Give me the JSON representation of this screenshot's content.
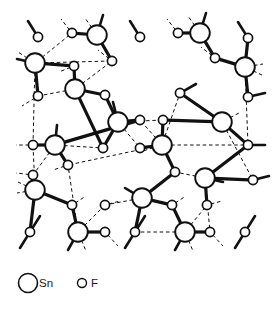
{
  "figure": {
    "name": "sn-f-crystal-structure",
    "background_color": "#ffffff",
    "stroke_color": "#111111",
    "atom_fill": "#ffffff"
  },
  "legend": {
    "items": [
      {
        "symbol": "Sn",
        "label": "Sn",
        "marker": "large-open-circle",
        "radius": 9.5
      },
      {
        "symbol": "F",
        "label": "F",
        "marker": "small-open-circle",
        "radius": 4.5
      }
    ],
    "sn_label": "Sn",
    "f_label": "F",
    "sn_marker_cx": 28,
    "sn_marker_cy": 283,
    "sn_text_x": 39,
    "sn_text_y": 287,
    "f_marker_cx": 82,
    "f_marker_cy": 283,
    "f_text_x": 91,
    "f_text_y": 287
  },
  "structure": {
    "sn_radius": 9.8,
    "f_radius": 4.6,
    "bond_width": 3.2,
    "dash_width": 1.0,
    "dash_pattern": "3.5,2.8",
    "stub_width": 2.6,
    "sn_atoms": [
      {
        "id": "sn1",
        "x": 35,
        "y": 63
      },
      {
        "id": "sn2",
        "x": 97,
        "y": 35
      },
      {
        "id": "sn3",
        "x": 75,
        "y": 89
      },
      {
        "id": "sn4",
        "x": 118,
        "y": 122
      },
      {
        "id": "sn5",
        "x": 162,
        "y": 145
      },
      {
        "id": "sn6",
        "x": 200,
        "y": 33
      },
      {
        "id": "sn7",
        "x": 245,
        "y": 67
      },
      {
        "id": "sn8",
        "x": 222,
        "y": 122
      },
      {
        "id": "sn9",
        "x": 55,
        "y": 145
      },
      {
        "id": "sn10",
        "x": 35,
        "y": 190
      },
      {
        "id": "sn11",
        "x": 78,
        "y": 232
      },
      {
        "id": "sn12",
        "x": 142,
        "y": 198
      },
      {
        "id": "sn13",
        "x": 185,
        "y": 232
      },
      {
        "id": "sn14",
        "x": 205,
        "y": 178
      }
    ],
    "f_atoms": [
      {
        "id": "f1",
        "x": 38,
        "y": 37
      },
      {
        "id": "f2",
        "x": 72,
        "y": 33
      },
      {
        "id": "f3",
        "x": 140,
        "y": 37
      },
      {
        "id": "f4",
        "x": 178,
        "y": 33
      },
      {
        "id": "f5",
        "x": 248,
        "y": 38
      },
      {
        "id": "f6",
        "x": 74,
        "y": 66
      },
      {
        "id": "f7",
        "x": 112,
        "y": 61
      },
      {
        "id": "f8",
        "x": 215,
        "y": 58
      },
      {
        "id": "f9",
        "x": 38,
        "y": 96
      },
      {
        "id": "f10",
        "x": 105,
        "y": 95
      },
      {
        "id": "f11",
        "x": 180,
        "y": 93
      },
      {
        "id": "f12",
        "x": 248,
        "y": 97
      },
      {
        "id": "f13",
        "x": 140,
        "y": 120
      },
      {
        "id": "f14",
        "x": 163,
        "y": 120
      },
      {
        "id": "f15",
        "x": 33,
        "y": 145
      },
      {
        "id": "f16",
        "x": 103,
        "y": 148
      },
      {
        "id": "f17",
        "x": 140,
        "y": 148
      },
      {
        "id": "f18",
        "x": 248,
        "y": 145
      },
      {
        "id": "f19",
        "x": 33,
        "y": 175
      },
      {
        "id": "f20",
        "x": 68,
        "y": 165
      },
      {
        "id": "f21",
        "x": 175,
        "y": 172
      },
      {
        "id": "f22",
        "x": 253,
        "y": 180
      },
      {
        "id": "f23",
        "x": 72,
        "y": 205
      },
      {
        "id": "f24",
        "x": 105,
        "y": 205
      },
      {
        "id": "f25",
        "x": 172,
        "y": 205
      },
      {
        "id": "f26",
        "x": 207,
        "y": 205
      },
      {
        "id": "f27",
        "x": 30,
        "y": 232
      },
      {
        "id": "f28",
        "x": 105,
        "y": 232
      },
      {
        "id": "f29",
        "x": 135,
        "y": 232
      },
      {
        "id": "f30",
        "x": 210,
        "y": 232
      },
      {
        "id": "f31",
        "x": 245,
        "y": 232
      }
    ],
    "bonds": [
      {
        "from": "sn1",
        "to": "f6"
      },
      {
        "from": "sn1",
        "to": "f9"
      },
      {
        "from": "sn2",
        "to": "f2"
      },
      {
        "from": "sn2",
        "to": "f7"
      },
      {
        "from": "sn3",
        "to": "f6"
      },
      {
        "from": "sn3",
        "to": "f10"
      },
      {
        "from": "sn3",
        "to": "f16"
      },
      {
        "from": "sn4",
        "to": "f10"
      },
      {
        "from": "sn4",
        "to": "f13"
      },
      {
        "from": "sn4",
        "to": "f16"
      },
      {
        "from": "sn5",
        "to": "f14"
      },
      {
        "from": "sn5",
        "to": "f17"
      },
      {
        "from": "sn5",
        "to": "f21"
      },
      {
        "from": "sn6",
        "to": "f4"
      },
      {
        "from": "sn6",
        "to": "f8"
      },
      {
        "from": "sn7",
        "to": "f5"
      },
      {
        "from": "sn7",
        "to": "f8"
      },
      {
        "from": "sn7",
        "to": "f12"
      },
      {
        "from": "sn8",
        "to": "f11"
      },
      {
        "from": "sn8",
        "to": "f14"
      },
      {
        "from": "sn8",
        "to": "f18"
      },
      {
        "from": "sn9",
        "to": "f15"
      },
      {
        "from": "sn9",
        "to": "f20"
      },
      {
        "from": "sn9",
        "to": "f13"
      },
      {
        "from": "sn10",
        "to": "f19"
      },
      {
        "from": "sn10",
        "to": "f23"
      },
      {
        "from": "sn10",
        "to": "f27"
      },
      {
        "from": "sn11",
        "to": "f23"
      },
      {
        "from": "sn11",
        "to": "f28"
      },
      {
        "from": "sn12",
        "to": "f21"
      },
      {
        "from": "sn12",
        "to": "f25"
      },
      {
        "from": "sn12",
        "to": "f29"
      },
      {
        "from": "sn13",
        "to": "f25"
      },
      {
        "from": "sn13",
        "to": "f30"
      },
      {
        "from": "sn14",
        "to": "f22"
      },
      {
        "from": "sn14",
        "to": "f26"
      },
      {
        "from": "sn14",
        "to": "f18"
      }
    ],
    "contacts": [
      {
        "from": "sn1",
        "to": "f7"
      },
      {
        "from": "sn1",
        "to": "f2"
      },
      {
        "from": "sn1",
        "to": "f15"
      },
      {
        "from": "sn2",
        "to": "f7"
      },
      {
        "from": "sn3",
        "to": "f7"
      },
      {
        "from": "sn3",
        "to": "f9"
      },
      {
        "from": "sn4",
        "to": "f17"
      },
      {
        "from": "sn5",
        "to": "f13"
      },
      {
        "from": "sn5",
        "to": "f11"
      },
      {
        "from": "sn5",
        "to": "f18"
      },
      {
        "from": "sn5",
        "to": "f20"
      },
      {
        "from": "sn6",
        "to": "f8"
      },
      {
        "from": "sn7",
        "to": "f18"
      },
      {
        "from": "sn8",
        "to": "f22"
      },
      {
        "from": "sn9",
        "to": "f19"
      },
      {
        "from": "sn9",
        "to": "f16"
      },
      {
        "from": "sn10",
        "to": "f15"
      },
      {
        "from": "sn11",
        "to": "f24"
      },
      {
        "from": "sn11",
        "to": "f20"
      },
      {
        "from": "sn12",
        "to": "f24"
      },
      {
        "from": "sn13",
        "to": "f26"
      },
      {
        "from": "sn13",
        "to": "f29"
      },
      {
        "from": "sn14",
        "to": "f21"
      },
      {
        "from": "sn14",
        "to": "f30"
      },
      {
        "from": "sn4",
        "to": "f14"
      }
    ],
    "stubs": [
      {
        "x": 38,
        "y": 37,
        "dx": -10,
        "dy": -16,
        "type": "bond"
      },
      {
        "x": 72,
        "y": 33,
        "dx": -11,
        "dy": -14,
        "type": "dash"
      },
      {
        "x": 97,
        "y": 35,
        "dx": 6,
        "dy": -20,
        "type": "bond"
      },
      {
        "x": 97,
        "y": 35,
        "dx": -12,
        "dy": -17,
        "type": "dash"
      },
      {
        "x": 140,
        "y": 37,
        "dx": -10,
        "dy": -16,
        "type": "bond"
      },
      {
        "x": 178,
        "y": 33,
        "dx": -11,
        "dy": -14,
        "type": "dash"
      },
      {
        "x": 200,
        "y": 33,
        "dx": 6,
        "dy": -20,
        "type": "bond"
      },
      {
        "x": 200,
        "y": 33,
        "dx": -12,
        "dy": -17,
        "type": "dash"
      },
      {
        "x": 248,
        "y": 38,
        "dx": -10,
        "dy": -16,
        "type": "bond"
      },
      {
        "x": 35,
        "y": 63,
        "dx": -18,
        "dy": -4,
        "type": "bond"
      },
      {
        "x": 35,
        "y": 63,
        "dx": -17,
        "dy": -11,
        "type": "dash"
      },
      {
        "x": 245,
        "y": 67,
        "dx": 18,
        "dy": -3,
        "type": "dash"
      },
      {
        "x": 245,
        "y": 67,
        "dx": 17,
        "dy": 8,
        "type": "dash"
      },
      {
        "x": 248,
        "y": 97,
        "dx": 17,
        "dy": -4,
        "type": "bond"
      },
      {
        "x": 38,
        "y": 96,
        "dx": -16,
        "dy": 10,
        "type": "dash"
      },
      {
        "x": 33,
        "y": 145,
        "dx": -17,
        "dy": 0,
        "type": "dash"
      },
      {
        "x": 248,
        "y": 145,
        "dx": 17,
        "dy": 0,
        "type": "bond"
      },
      {
        "x": 33,
        "y": 175,
        "dx": -17,
        "dy": -2,
        "type": "dash"
      },
      {
        "x": 35,
        "y": 190,
        "dx": -18,
        "dy": 3,
        "type": "dash"
      },
      {
        "x": 35,
        "y": 190,
        "dx": -17,
        "dy": -8,
        "type": "dash"
      },
      {
        "x": 253,
        "y": 180,
        "dx": 16,
        "dy": -4,
        "type": "bond"
      },
      {
        "x": 205,
        "y": 178,
        "dx": 18,
        "dy": 4,
        "type": "bond"
      },
      {
        "x": 30,
        "y": 232,
        "dx": 10,
        "dy": -16,
        "type": "bond"
      },
      {
        "x": 30,
        "y": 232,
        "dx": -10,
        "dy": 16,
        "type": "bond"
      },
      {
        "x": 78,
        "y": 232,
        "dx": -10,
        "dy": 18,
        "type": "bond"
      },
      {
        "x": 78,
        "y": 232,
        "dx": 8,
        "dy": 19,
        "type": "dash"
      },
      {
        "x": 105,
        "y": 232,
        "dx": 13,
        "dy": 14,
        "type": "dash"
      },
      {
        "x": 135,
        "y": 232,
        "dx": 10,
        "dy": -16,
        "type": "bond"
      },
      {
        "x": 135,
        "y": 232,
        "dx": -10,
        "dy": 16,
        "type": "bond"
      },
      {
        "x": 185,
        "y": 232,
        "dx": -10,
        "dy": 18,
        "type": "bond"
      },
      {
        "x": 185,
        "y": 232,
        "dx": 8,
        "dy": 19,
        "type": "dash"
      },
      {
        "x": 210,
        "y": 232,
        "dx": 13,
        "dy": 14,
        "type": "dash"
      },
      {
        "x": 245,
        "y": 232,
        "dx": 10,
        "dy": -16,
        "type": "bond"
      },
      {
        "x": 245,
        "y": 232,
        "dx": -10,
        "dy": 16,
        "type": "bond"
      },
      {
        "x": 72,
        "y": 205,
        "dx": 14,
        "dy": -9,
        "type": "dash"
      },
      {
        "x": 172,
        "y": 205,
        "dx": 14,
        "dy": -9,
        "type": "dash"
      },
      {
        "x": 105,
        "y": 205,
        "dx": 15,
        "dy": -4,
        "type": "dash"
      },
      {
        "x": 207,
        "y": 205,
        "dx": 15,
        "dy": -4,
        "type": "dash"
      },
      {
        "x": 118,
        "y": 122,
        "dx": -5,
        "dy": -20,
        "type": "bond"
      },
      {
        "x": 162,
        "y": 145,
        "dx": -19,
        "dy": 6,
        "type": "dash"
      },
      {
        "x": 222,
        "y": 122,
        "dx": 17,
        "dy": -9,
        "type": "dash"
      },
      {
        "x": 55,
        "y": 145,
        "dx": 2,
        "dy": -20,
        "type": "bond"
      },
      {
        "x": 142,
        "y": 198,
        "dx": -17,
        "dy": -10,
        "type": "bond"
      },
      {
        "x": 180,
        "y": 93,
        "dx": 16,
        "dy": -9,
        "type": "bond"
      },
      {
        "x": 112,
        "y": 61,
        "dx": -14,
        "dy": -11,
        "type": "dash"
      },
      {
        "x": 215,
        "y": 58,
        "dx": -14,
        "dy": -11,
        "type": "dash"
      },
      {
        "x": 74,
        "y": 66,
        "dx": -15,
        "dy": 6,
        "type": "dash"
      },
      {
        "x": 68,
        "y": 165,
        "dx": -15,
        "dy": 5,
        "type": "dash"
      }
    ]
  }
}
